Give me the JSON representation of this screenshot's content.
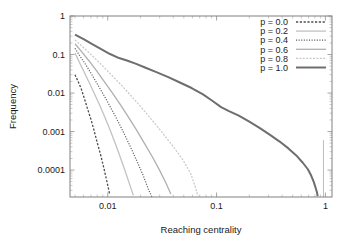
{
  "chart_data": {
    "type": "line",
    "title": "",
    "xlabel": "Reaching centrality",
    "ylabel": "Frequency",
    "xscale": "log",
    "yscale": "log",
    "xlim": [
      0.0045,
      1.15
    ],
    "ylim": [
      2e-05,
      1.0
    ],
    "grid": false,
    "legend_position": "top-right",
    "xticks": [
      "0.01",
      "0.1",
      "1"
    ],
    "xtick_values": [
      0.01,
      0.1,
      1
    ],
    "yticks": [
      "1",
      "0.1",
      "0.01",
      "0.001",
      "0.0001"
    ],
    "ytick_values": [
      1,
      0.1,
      0.01,
      0.001,
      0.0001
    ],
    "series": [
      {
        "name": "p = 0.0",
        "color": "#4d4d4d",
        "dash": "2.2,1.6",
        "width": 1.3,
        "points": [
          [
            0.005,
            0.03
          ],
          [
            0.0053,
            0.021
          ],
          [
            0.0057,
            0.013
          ],
          [
            0.0061,
            0.0072
          ],
          [
            0.0065,
            0.004
          ],
          [
            0.007,
            0.0021
          ],
          [
            0.0075,
            0.00105
          ],
          [
            0.008,
            0.00052
          ],
          [
            0.0086,
            0.00025
          ],
          [
            0.0092,
            0.000115
          ],
          [
            0.0098,
            5.2e-05
          ],
          [
            0.0104,
            2.4e-05
          ]
        ]
      },
      {
        "name": "p = 0.2",
        "color": "#c2c2c2",
        "dash": "none",
        "width": 1.3,
        "points": [
          [
            0.005,
            0.11
          ],
          [
            0.0055,
            0.062
          ],
          [
            0.0061,
            0.034
          ],
          [
            0.0068,
            0.018
          ],
          [
            0.0076,
            0.0092
          ],
          [
            0.0085,
            0.0046
          ],
          [
            0.0095,
            0.0022
          ],
          [
            0.0106,
            0.00103
          ],
          [
            0.0118,
            0.00047
          ],
          [
            0.0131,
            0.00021
          ],
          [
            0.0145,
            9.2e-05
          ],
          [
            0.016,
            4e-05
          ],
          [
            0.0172,
            2.2e-05
          ]
        ]
      },
      {
        "name": "p = 0.4",
        "color": "#5a5a5a",
        "dash": "1.1,1.5",
        "width": 1.2,
        "points": [
          [
            0.005,
            0.145
          ],
          [
            0.0056,
            0.088
          ],
          [
            0.0064,
            0.05
          ],
          [
            0.0073,
            0.027
          ],
          [
            0.0083,
            0.0145
          ],
          [
            0.0095,
            0.0075
          ],
          [
            0.0109,
            0.0037
          ],
          [
            0.0125,
            0.00178
          ],
          [
            0.0143,
            0.00083
          ],
          [
            0.0163,
            0.00038
          ],
          [
            0.0186,
            0.000168
          ],
          [
            0.0212,
            7.2e-05
          ],
          [
            0.0236,
            3.2e-05
          ],
          [
            0.0255,
            2e-05
          ]
        ]
      },
      {
        "name": "p = 0.6",
        "color": "#b0b0b0",
        "dash": "none",
        "width": 1.3,
        "points": [
          [
            0.005,
            0.19
          ],
          [
            0.0058,
            0.115
          ],
          [
            0.0068,
            0.066
          ],
          [
            0.008,
            0.036
          ],
          [
            0.0094,
            0.019
          ],
          [
            0.0111,
            0.0098
          ],
          [
            0.0131,
            0.0049
          ],
          [
            0.0155,
            0.00238
          ],
          [
            0.0183,
            0.00112
          ],
          [
            0.0216,
            0.00051
          ],
          [
            0.0256,
            0.000225
          ],
          [
            0.03,
            9.8e-05
          ],
          [
            0.0345,
            4.4e-05
          ],
          [
            0.038,
            2.4e-05
          ]
        ]
      },
      {
        "name": "p = 0.8",
        "color": "#c8c8c8",
        "dash": "2.0,1.4",
        "width": 1.2,
        "points": [
          [
            0.005,
            0.24
          ],
          [
            0.006,
            0.15
          ],
          [
            0.0073,
            0.09
          ],
          [
            0.0089,
            0.052
          ],
          [
            0.0109,
            0.029
          ],
          [
            0.0134,
            0.0158
          ],
          [
            0.0165,
            0.0083
          ],
          [
            0.0204,
            0.0042
          ],
          [
            0.0253,
            0.00205
          ],
          [
            0.0315,
            0.00096
          ],
          [
            0.0393,
            0.00043
          ],
          [
            0.049,
            0.000185
          ],
          [
            0.058,
            8e-05
          ],
          [
            0.064,
            3.5e-05
          ],
          [
            0.0675,
            2.1e-05
          ]
        ]
      },
      {
        "name": "p = 1.0",
        "color": "#6e6e6e",
        "dash": "none",
        "width": 2.0,
        "points": [
          [
            0.005,
            0.33
          ],
          [
            0.006,
            0.25
          ],
          [
            0.0072,
            0.185
          ],
          [
            0.0087,
            0.138
          ],
          [
            0.0105,
            0.103
          ],
          [
            0.0127,
            0.081
          ],
          [
            0.015,
            0.07
          ],
          [
            0.018,
            0.058
          ],
          [
            0.022,
            0.046
          ],
          [
            0.028,
            0.035
          ],
          [
            0.036,
            0.026
          ],
          [
            0.046,
            0.0188
          ],
          [
            0.059,
            0.0135
          ],
          [
            0.075,
            0.0092
          ],
          [
            0.092,
            0.0062
          ],
          [
            0.11,
            0.0043
          ],
          [
            0.13,
            0.0034
          ],
          [
            0.16,
            0.0026
          ],
          [
            0.2,
            0.0018
          ],
          [
            0.25,
            0.00123
          ],
          [
            0.31,
            0.00082
          ],
          [
            0.38,
            0.00055
          ],
          [
            0.46,
            0.00036
          ],
          [
            0.54,
            0.00024
          ],
          [
            0.62,
            0.000155
          ],
          [
            0.69,
            0.000105
          ],
          [
            0.74,
            7.2e-05
          ],
          [
            0.78,
            5e-05
          ],
          [
            0.81,
            3.6e-05
          ],
          [
            0.835,
            2.7e-05
          ],
          [
            0.85,
            2.1e-05
          ]
        ]
      }
    ],
    "annotations": [
      {
        "name": "vertical-spike-at-one",
        "x": 0.96,
        "y_top": 0.0006,
        "y_bottom": 2e-05,
        "color": "#b5b5b5"
      }
    ]
  }
}
